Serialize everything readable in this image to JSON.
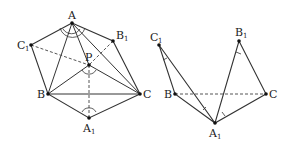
{
  "figure_left": {
    "labels": {
      "A": "A",
      "B1": "B",
      "C1": "C",
      "P": "P",
      "B": "B",
      "C": "C",
      "A1": "A"
    },
    "subscripts": {
      "B1": "1",
      "C1": "1",
      "A1": "1"
    }
  },
  "figure_right": {
    "labels": {
      "C1": "C",
      "B1": "B",
      "B": "B",
      "C": "C",
      "A1": "A"
    },
    "subscripts": {
      "C1": "1",
      "B1": "1",
      "A1": "1"
    }
  },
  "colors": {
    "line": "#333333",
    "dash": "#555555",
    "point": "#111111"
  }
}
